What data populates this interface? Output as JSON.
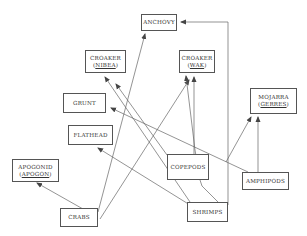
{
  "diagram": {
    "type": "food-web",
    "nodes": [
      {
        "id": "anchovy",
        "label": "ANCHOVY",
        "sci": null,
        "box": [
          141,
          14,
          36,
          17
        ]
      },
      {
        "id": "croaker_nibea",
        "label": "CROAKER",
        "sci": "NIBEA",
        "box": [
          85,
          50,
          41,
          23
        ]
      },
      {
        "id": "croaker_wak",
        "label": "CROAKER",
        "sci": "WAK",
        "box": [
          179,
          50,
          36,
          23
        ]
      },
      {
        "id": "grunt",
        "label": "GRUNT",
        "sci": null,
        "box": [
          63,
          93,
          43,
          20
        ]
      },
      {
        "id": "flathead",
        "label": "FLATHEAD",
        "sci": null,
        "box": [
          68,
          125,
          45,
          20
        ]
      },
      {
        "id": "mojarra_gerres",
        "label": "MOJARRA",
        "sci": "GERRES",
        "box": [
          250,
          88,
          47,
          26
        ]
      },
      {
        "id": "apogonid_apogon",
        "label": "APOGONID",
        "sci": "APOGON",
        "box": [
          12,
          159,
          47,
          23
        ]
      },
      {
        "id": "copepods",
        "label": "COPEPODS",
        "sci": null,
        "box": [
          167,
          154,
          42,
          26
        ]
      },
      {
        "id": "amphipods",
        "label": "AMPHIPODS",
        "sci": null,
        "box": [
          242,
          172,
          47,
          18
        ]
      },
      {
        "id": "crabs",
        "label": "CRABS",
        "sci": null,
        "box": [
          60,
          208,
          38,
          19
        ]
      },
      {
        "id": "shrimps",
        "label": "SHRIMPS",
        "sci": null,
        "box": [
          187,
          202,
          41,
          20
        ]
      }
    ],
    "edges": [
      {
        "from": "crabs",
        "to": "apogonid_apogon"
      },
      {
        "from": "crabs",
        "to": "anchovy"
      },
      {
        "from": "crabs",
        "to": "croaker_wak"
      },
      {
        "from": "shrimps",
        "to": "anchovy",
        "routing": "elbow"
      },
      {
        "from": "shrimps",
        "to": "croaker_nibea"
      },
      {
        "from": "shrimps",
        "to": "croaker_wak"
      },
      {
        "from": "shrimps",
        "to": "flathead"
      },
      {
        "from": "shrimps",
        "to": "mojarra_gerres"
      },
      {
        "from": "copepods",
        "to": "croaker_nibea"
      },
      {
        "from": "copepods",
        "to": "croaker_wak"
      },
      {
        "from": "amphipods",
        "to": "grunt"
      },
      {
        "from": "amphipods",
        "to": "mojarra_gerres"
      }
    ],
    "lines": [
      [
        83,
        209,
        37,
        183
      ],
      [
        98,
        212,
        145,
        34
      ],
      [
        100,
        219,
        189,
        80
      ],
      [
        228,
        205,
        228,
        22,
        181,
        22
      ],
      [
        218,
        202,
        202,
        186,
        200,
        180,
        195,
        150,
        186,
        76
      ],
      [
        190,
        202,
        105,
        77
      ],
      [
        190,
        205,
        98,
        148
      ],
      [
        226,
        162,
        251,
        117
      ],
      [
        167,
        155,
        116,
        84
      ],
      [
        194,
        154,
        194,
        77
      ],
      [
        248,
        172,
        111,
        108
      ],
      [
        258,
        172,
        258,
        117
      ]
    ]
  }
}
